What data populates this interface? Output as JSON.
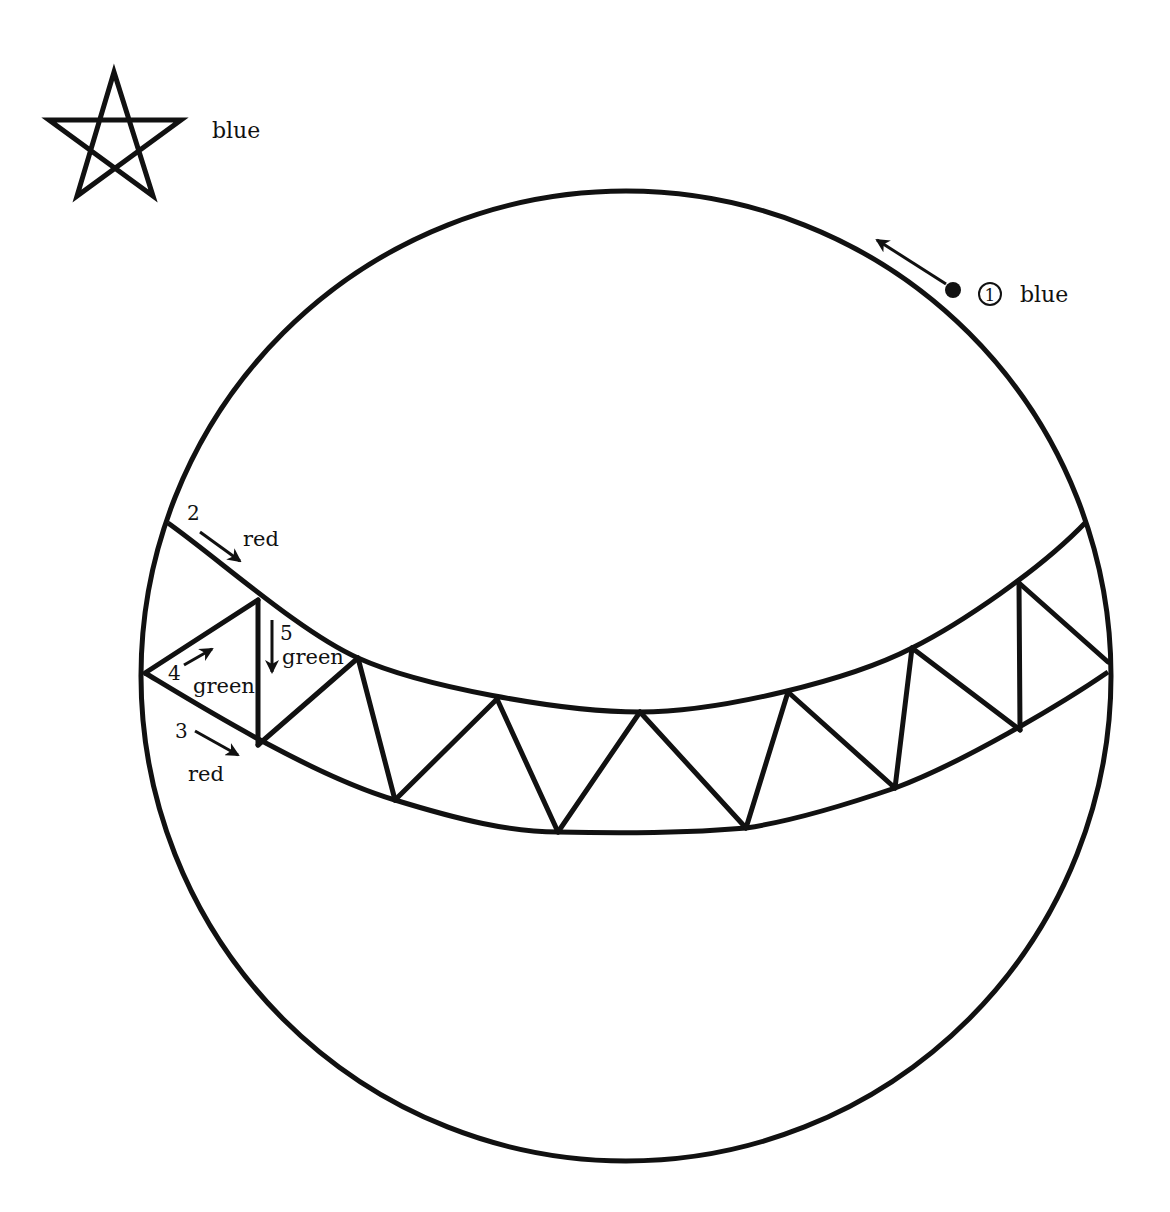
{
  "diagram": {
    "type": "sphere-with-triangulated-band",
    "stroke_color": "#111111",
    "background": "#ffffff",
    "legend": {
      "symbol": "star-icon",
      "label": "blue"
    },
    "markers": [
      {
        "id": "1",
        "label": "1",
        "color_label": "blue",
        "kind": "circled-number",
        "arrow": "up-left along circle"
      },
      {
        "id": "2",
        "label": "2",
        "color_label": "red",
        "kind": "number",
        "arrow": "down-right along upper band edge"
      },
      {
        "id": "3",
        "label": "3",
        "color_label": "red",
        "kind": "number",
        "arrow": "down-right along lower band edge"
      },
      {
        "id": "4",
        "label": "4",
        "color_label": "green",
        "kind": "number",
        "arrow": "up-right along diagonal"
      },
      {
        "id": "5",
        "label": "5",
        "color_label": "green",
        "kind": "number",
        "arrow": "down along vertical"
      }
    ],
    "circle": {
      "cx": 626,
      "cy": 676,
      "r": 485
    },
    "band": {
      "upper_edge": [
        [
          168,
          523
        ],
        [
          258,
          600
        ],
        [
          358,
          658
        ],
        [
          497,
          699
        ],
        [
          640,
          712
        ],
        [
          788,
          692
        ],
        [
          912,
          648
        ],
        [
          1019,
          583
        ],
        [
          1086,
          522
        ]
      ],
      "lower_edge": [
        [
          145,
          673
        ],
        [
          258,
          745
        ],
        [
          395,
          800
        ],
        [
          558,
          832
        ],
        [
          746,
          828
        ],
        [
          895,
          788
        ],
        [
          1020,
          730
        ],
        [
          1108,
          672
        ]
      ],
      "triangle_count": 12
    }
  }
}
